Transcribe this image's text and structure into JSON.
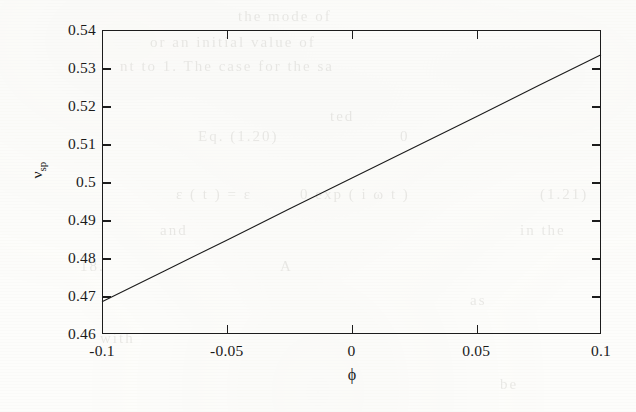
{
  "figure": {
    "background_color": "#fdfdfb",
    "ink_color": "#1c1c1c"
  },
  "axis": {
    "y_label_symbol": "ν",
    "y_label_subscript": "sp",
    "x_label_symbol": "ϕ"
  },
  "chart_data": {
    "type": "line",
    "title": "",
    "xlabel": "ϕ",
    "ylabel": "ν_sp",
    "xlim": [
      -0.1,
      0.1
    ],
    "ylim": [
      0.46,
      0.54
    ],
    "grid": false,
    "legend": null,
    "x_ticks": [
      -0.1,
      -0.05,
      0,
      0.05,
      0.1
    ],
    "x_tick_labels": [
      "-0.1",
      "-0.05",
      "0",
      "0.05",
      "0.1"
    ],
    "y_ticks": [
      0.46,
      0.47,
      0.48,
      0.49,
      0.5,
      0.51,
      0.52,
      0.53,
      0.54
    ],
    "y_tick_labels": [
      "0.46",
      "0.47",
      "0.48",
      "0.49",
      "0.5",
      "0.51",
      "0.52",
      "0.53",
      "0.54"
    ],
    "tick_direction": "in",
    "series": [
      {
        "name": "nu_sp",
        "style": "solid",
        "color": "#1c1c1c",
        "linewidth": 1.1,
        "x": [
          -0.1,
          -0.075,
          -0.05,
          -0.025,
          0,
          0.025,
          0.05,
          0.075,
          0.1
        ],
        "y": [
          0.4685,
          0.4766,
          0.4847,
          0.4929,
          0.501,
          0.5091,
          0.5172,
          0.5254,
          0.5335
        ]
      }
    ]
  },
  "bleed_through": [
    {
      "text": "the    mode    of",
      "x": 238,
      "y": 8
    },
    {
      "text": "or   an   initial   value   of",
      "x": 150,
      "y": 34
    },
    {
      "text": "nt    to     1.  The    case   for    the   sa",
      "x": 120,
      "y": 58
    },
    {
      "text": "ted",
      "x": 330,
      "y": 108
    },
    {
      "text": "Eq.  (1.20)",
      "x": 198,
      "y": 128
    },
    {
      "text": "0",
      "x": 400,
      "y": 128
    },
    {
      "text": "ε ( t )   =   ε",
      "x": 176,
      "y": 186
    },
    {
      "text": "0   exp ( i ω t )",
      "x": 300,
      "y": 186
    },
    {
      "text": "(1.21)",
      "x": 540,
      "y": 186
    },
    {
      "text": "and",
      "x": 160,
      "y": 222
    },
    {
      "text": "in  the",
      "x": 520,
      "y": 222
    },
    {
      "text": "18.",
      "x": 80,
      "y": 258
    },
    {
      "text": "A",
      "x": 280,
      "y": 258
    },
    {
      "text": "as",
      "x": 470,
      "y": 292
    },
    {
      "text": "with",
      "x": 100,
      "y": 330
    },
    {
      "text": "be",
      "x": 500,
      "y": 376
    }
  ]
}
